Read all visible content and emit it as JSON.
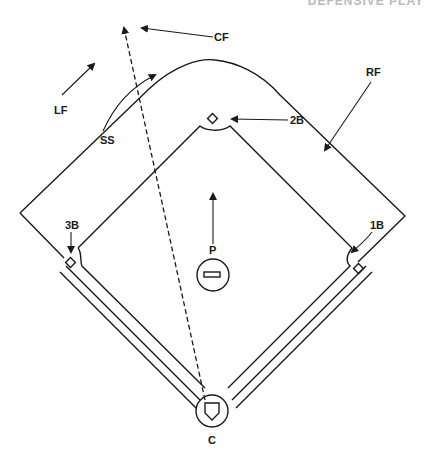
{
  "header": {
    "text": "DEFENSIVE PLAY",
    "note": "cropped at top edge"
  },
  "diagram": {
    "positions": {
      "lf": "LF",
      "cf": "CF",
      "rf": "RF",
      "ss": "SS",
      "second_base": "2B",
      "third_base": "3B",
      "first_base": "1B",
      "pitcher": "P",
      "catcher": "C"
    },
    "colors": {
      "ink": "#1a1a1a",
      "background": "#ffffff"
    }
  }
}
